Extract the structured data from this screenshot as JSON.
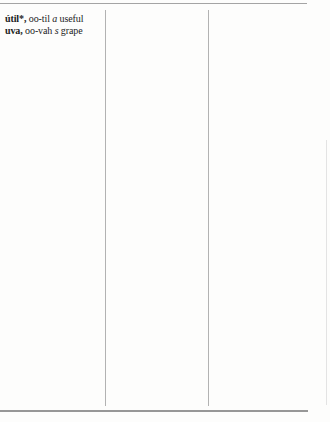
{
  "page": {
    "kind": "scanned dictionary page",
    "columns": 3
  },
  "entries": [
    {
      "headword": "útil*,",
      "pronunciation": "oo-til",
      "pos": "a",
      "definition": "useful"
    },
    {
      "headword": "uva,",
      "pronunciation": "oo-vah",
      "pos": "s",
      "definition": "grape"
    }
  ],
  "colors": {
    "background": "#fdfdfc",
    "rule_gray": "#a4a4a4",
    "rule_dark": "#979797",
    "rule_light": "#b2b2b2",
    "edge_gray": "#e3e3e3",
    "text": "#1c1c1c"
  }
}
